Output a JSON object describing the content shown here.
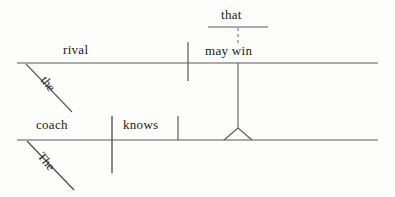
{
  "diagram": {
    "type": "reed-kellogg-sentence-diagram",
    "sentence": "The coach knows the rival that may win.",
    "ink_color": "#4a4a4a",
    "text_color": "#1b1b1b",
    "background_color": "#fdfdfc",
    "main_clause": {
      "subject": "coach",
      "subject_modifier": "The",
      "verb": "knows",
      "direct_object_slot_label": ""
    },
    "relative_clause": {
      "head_noun": "rival",
      "head_noun_modifier": "the",
      "relative_pronoun": "that",
      "predicate": "may win"
    },
    "labels": {
      "subject": "coach",
      "verb": "knows",
      "object_noun": "rival",
      "relative_verb": "may win",
      "relative_pronoun": "that",
      "article_lower": "The",
      "article_upper": "the"
    },
    "lines": {
      "upper_baseline": {
        "x1": 17,
        "y1": 63,
        "x2": 378,
        "y2": 63
      },
      "lower_baseline": {
        "x1": 17,
        "y1": 140,
        "x2": 378,
        "y2": 140
      },
      "relative_pronoun_line": {
        "x1": 208,
        "y1": 27,
        "x2": 268,
        "y2": 27
      },
      "upper_divider": {
        "x1": 188,
        "y1": 42,
        "x2": 188,
        "y2": 81
      },
      "subject_verb_divider": {
        "x1": 112,
        "y1": 116,
        "x2": 112,
        "y2": 173
      },
      "object_divider": {
        "x1": 178,
        "y1": 116,
        "x2": 178,
        "y2": 140
      },
      "clause_connector": {
        "x1": 238,
        "y1": 63,
        "x2": 238,
        "y2": 128
      },
      "relative_dashed_connector": {
        "x1": 238,
        "y1": 28,
        "x2": 238,
        "y2": 45
      },
      "article_slant_upper": {
        "x1": 26,
        "y1": 64,
        "x2": 72,
        "y2": 112
      },
      "article_slant_lower": {
        "x1": 27,
        "y1": 141,
        "x2": 74,
        "y2": 190
      },
      "triangle": {
        "apex_x": 238,
        "apex_y": 128,
        "left_x": 224,
        "right_x": 252,
        "base_y": 140
      }
    }
  }
}
